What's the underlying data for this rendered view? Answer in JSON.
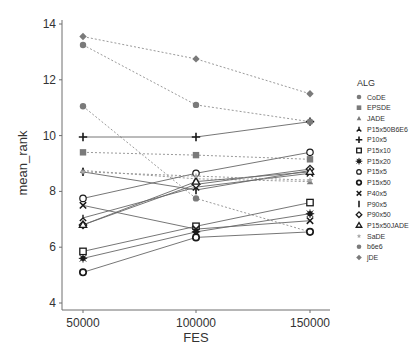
{
  "chart_data": {
    "type": "line",
    "title": "",
    "xlabel": "FES",
    "ylabel": "mean_rank",
    "x": [
      50000,
      100000,
      150000
    ],
    "x_tick_labels": [
      "50000",
      "100000",
      "150000"
    ],
    "ylim": [
      4,
      14
    ],
    "y_ticks": [
      4,
      6,
      8,
      10,
      12,
      14
    ],
    "grid": false,
    "legend_title": "ALG",
    "legend_position": "right",
    "series": [
      {
        "name": "CoDE",
        "marker": "circle-filled-gray",
        "line": "dotted",
        "values": [
          11.05,
          7.75,
          6.55
        ]
      },
      {
        "name": "EPSDE",
        "marker": "square-filled-gray",
        "line": "dotted",
        "values": [
          9.4,
          9.3,
          9.15
        ]
      },
      {
        "name": "JADE",
        "marker": "triangle-filled-gray",
        "line": "dotted",
        "values": [
          8.75,
          8.45,
          8.35
        ]
      },
      {
        "name": "P15x50B6E6",
        "marker": "tri-down",
        "line": "solid",
        "values": [
          7.05,
          8.15,
          8.65
        ]
      },
      {
        "name": "P10x5",
        "marker": "plus",
        "line": "solid",
        "values": [
          9.95,
          9.95,
          10.5
        ]
      },
      {
        "name": "P15x10",
        "marker": "square-open",
        "line": "solid",
        "values": [
          5.85,
          6.75,
          7.6
        ]
      },
      {
        "name": "P15x20",
        "marker": "asterisk-filled",
        "line": "solid",
        "values": [
          5.6,
          6.55,
          7.2
        ]
      },
      {
        "name": "P15x5",
        "marker": "circle-open",
        "line": "solid",
        "values": [
          7.75,
          8.65,
          9.4
        ]
      },
      {
        "name": "P15x50",
        "marker": "circle-open-thick",
        "line": "solid",
        "values": [
          5.1,
          6.35,
          6.55
        ]
      },
      {
        "name": "P40x5",
        "marker": "x",
        "line": "solid",
        "values": [
          7.5,
          6.65,
          6.95
        ]
      },
      {
        "name": "P90x5",
        "marker": "vbar",
        "line": "solid",
        "values": [
          8.7,
          8.05,
          8.75
        ]
      },
      {
        "name": "P90x50",
        "marker": "diamond-open",
        "line": "solid",
        "values": [
          6.8,
          8.25,
          8.8
        ]
      },
      {
        "name": "P15x50JADE",
        "marker": "triangle-open",
        "line": "solid",
        "values": [
          6.8,
          8.35,
          8.7
        ]
      },
      {
        "name": "SaDE",
        "marker": "star-gray",
        "line": "dotted",
        "values": [
          8.7,
          8.55,
          8.4
        ]
      },
      {
        "name": "b6e6",
        "marker": "circle-filled-gray",
        "line": "dotted",
        "values": [
          13.25,
          11.1,
          10.5
        ]
      },
      {
        "name": "jDE",
        "marker": "diamond-filled-gray",
        "line": "dotted",
        "values": [
          13.55,
          12.75,
          11.5
        ]
      }
    ]
  },
  "colors": {
    "axis": "#6e6e6e",
    "text": "#333333",
    "solid_line": "#666666",
    "dotted_line": "#9a9a9a",
    "marker_gray": "#7a7a7a",
    "marker_dark": "#1a1a1a"
  }
}
